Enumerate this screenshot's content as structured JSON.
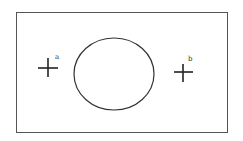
{
  "diagram": {
    "markers": [
      {
        "label": "a",
        "position": "left"
      },
      {
        "label": "b",
        "position": "right"
      }
    ],
    "colors": {
      "frame": "#555555",
      "ellipse": "#333333",
      "cross": "#222222",
      "background": "#ffffff"
    }
  }
}
